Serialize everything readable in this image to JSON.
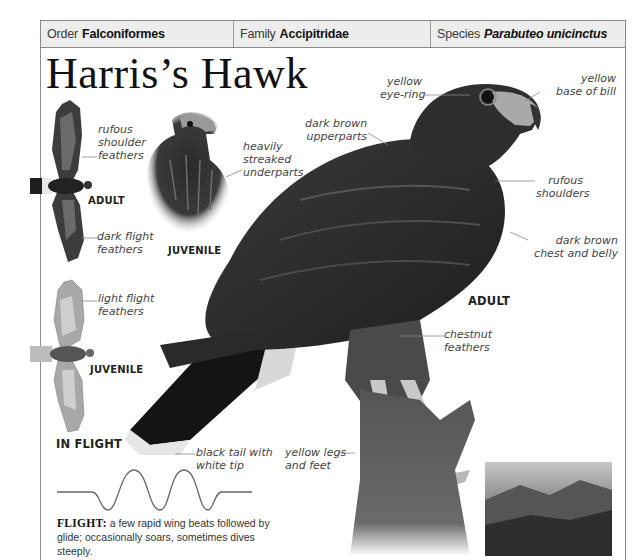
{
  "header": {
    "order": {
      "label": "Order",
      "value": "Falconiformes"
    },
    "family": {
      "label": "Family",
      "value": "Accipitridae"
    },
    "species": {
      "label": "Species",
      "value": "Parabuteo unicinctus"
    }
  },
  "title": "Harris’s Hawk",
  "in_flight": {
    "heading": "IN FLIGHT",
    "adult": {
      "tag": "ADULT",
      "labels": {
        "shoulder": [
          "rufous",
          "shoulder",
          "feathers"
        ],
        "flight": [
          "dark flight",
          "feathers"
        ]
      }
    },
    "juvenile": {
      "tag": "JUVENILE",
      "labels": {
        "flight": [
          "light flight",
          "feathers"
        ]
      }
    }
  },
  "juvenile_portrait": {
    "tag": "JUVENILE",
    "labels": {
      "underparts": [
        "heavily",
        "streaked",
        "underparts"
      ]
    }
  },
  "adult_main": {
    "tag": "ADULT",
    "labels": {
      "eye_ring": [
        "yellow",
        "eye-ring"
      ],
      "bill": [
        "yellow",
        "base of bill"
      ],
      "upperparts": [
        "dark brown",
        "upperparts"
      ],
      "shoulders": [
        "rufous",
        "shoulders"
      ],
      "chest": [
        "dark brown",
        "chest and belly"
      ],
      "chestnut": [
        "chestnut",
        "feathers"
      ],
      "tail": [
        "black tail with",
        "white tip"
      ],
      "legs": [
        "yellow legs",
        "and feet"
      ]
    }
  },
  "flight_pattern": {
    "heading": "FLIGHT:",
    "text": "a few rapid wing beats followed by glide; occasionally soars, sometimes dives steeply."
  },
  "colors": {
    "header_bg": "#ededed",
    "frame_line": "#8a8a8a",
    "text_dark": "#111111",
    "label_text": "#444444"
  }
}
